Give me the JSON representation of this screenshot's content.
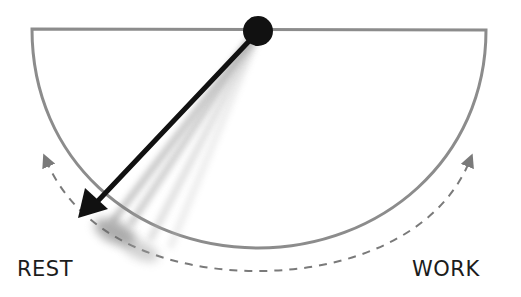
{
  "diagram": {
    "title": "",
    "labels": {
      "left": "REST",
      "right": "WORK"
    },
    "colors": {
      "bowl": "#8c8c8c",
      "dashed_arc": "#7a7a7a",
      "pendulum": "#111111",
      "pivot": "#111111",
      "background": "#ffffff"
    },
    "elements": [
      {
        "type": "half-bowl",
        "description": "semicircular bowl outline open at top"
      },
      {
        "type": "pivot",
        "description": "black dot at top center of bowl"
      },
      {
        "type": "pendulum-arrow",
        "description": "black arrow swinging from pivot toward REST side with motion blur trails"
      },
      {
        "type": "dashed-double-arrow-arc",
        "description": "dashed arc below bowl with arrowheads at both ends, indicating swing between REST and WORK"
      }
    ]
  }
}
